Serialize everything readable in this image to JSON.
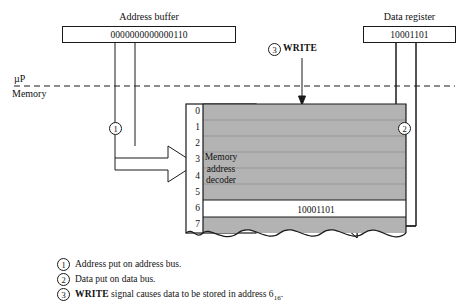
{
  "diagram": {
    "title_hidden": "Memory write operation diagram",
    "address_buffer": {
      "title": "Address buffer",
      "value": "0000000000000110"
    },
    "data_register": {
      "title": "Data register",
      "value": "10001101"
    },
    "boundary": {
      "upper_label": "µP",
      "lower_label": "Memory"
    },
    "write_signal": {
      "marker": "3",
      "label": "WRITE"
    },
    "bus_markers": {
      "address_bus": "1",
      "data_bus": "2"
    },
    "decoder": {
      "line1": "Memory",
      "line2": "address",
      "line3": "decoder"
    },
    "memory": {
      "row_labels": [
        "0",
        "1",
        "2",
        "3",
        "4",
        "5",
        "6",
        "7"
      ],
      "highlight_row_index": 6,
      "highlight_value": "10001101",
      "cell_fill_color": "#b3b3b3",
      "highlight_fill_color": "#ffffff"
    },
    "legend": [
      {
        "marker": "1",
        "text": "Address put on address bus."
      },
      {
        "marker": "2",
        "text": "Data put on data bus."
      },
      {
        "marker": "3",
        "text_pre": "WRITE",
        "text_mid": " signal causes data to be stored in address 6",
        "sub": "16",
        "text_post": "."
      }
    ]
  }
}
